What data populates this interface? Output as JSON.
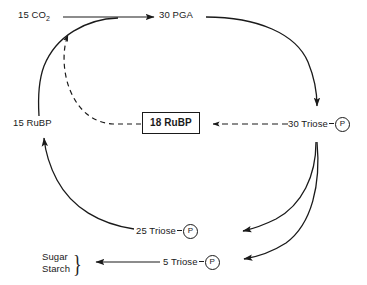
{
  "diagram": {
    "background_color": "#ffffff",
    "stroke_color": "#1a1a1a",
    "nodes": {
      "co2": {
        "label_prefix": "15 CO",
        "label_sub": "2"
      },
      "pga": {
        "label": "30 PGA"
      },
      "rubp_15": {
        "label": "15 RuBP"
      },
      "rubp_18": {
        "label": "18 RuBP"
      },
      "triose_30": {
        "label": "30 Triose",
        "phosphate": "P"
      },
      "triose_25": {
        "label": "25 Triose",
        "phosphate": "P"
      },
      "triose_5": {
        "label": "5 Triose",
        "phosphate": "P"
      },
      "products": {
        "line1": "Sugar",
        "line2": "Starch",
        "brace": "}"
      }
    },
    "edges": [
      {
        "name": "co2-to-pga",
        "from": "15 CO2",
        "to": "30 PGA",
        "style": "solid",
        "arrow": true
      },
      {
        "name": "pga-to-triose30",
        "from": "30 PGA",
        "to": "30 Triose P",
        "style": "solid",
        "arrow": true
      },
      {
        "name": "triose30-to-triose25",
        "from": "30 Triose P",
        "to": "25 Triose P",
        "style": "solid",
        "arrow": true
      },
      {
        "name": "triose30-to-triose5",
        "from": "30 Triose P",
        "to": "5 Triose P",
        "style": "solid",
        "arrow": true
      },
      {
        "name": "triose25-to-rubp15",
        "from": "25 Triose P",
        "to": "15 RuBP",
        "style": "solid",
        "arrow": true
      },
      {
        "name": "triose5-to-products",
        "from": "5 Triose P",
        "to": "Sugar Starch",
        "style": "solid",
        "arrow": true
      },
      {
        "name": "triose30-to-rubp18",
        "from": "30 Triose P",
        "to": "18 RuBP",
        "style": "dashed",
        "arrow": true
      },
      {
        "name": "rubp18-to-cycle",
        "from": "18 RuBP",
        "to": "CO2 fixation point",
        "style": "dashed",
        "arrow": true
      }
    ]
  }
}
